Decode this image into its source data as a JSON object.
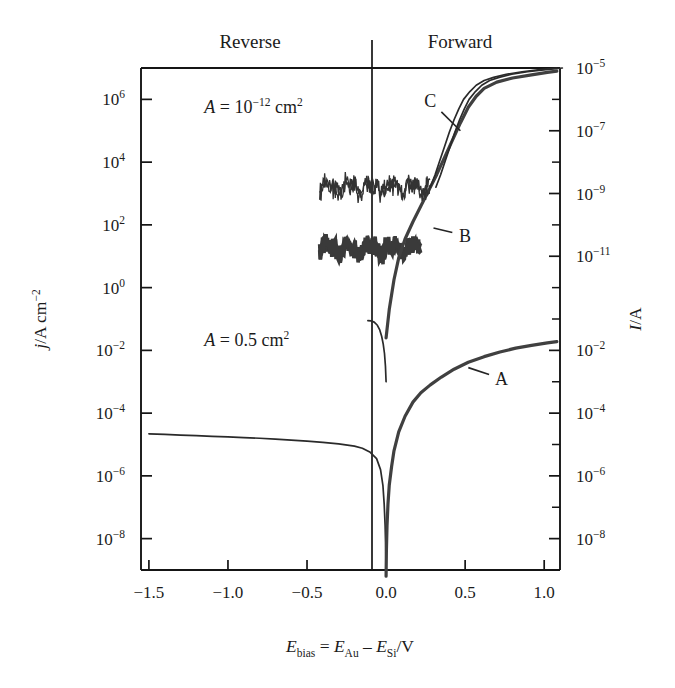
{
  "chart_data": {
    "type": "line",
    "title": "",
    "xlabel": "E_bias = E_Au − E_Si/V",
    "ylabel": "j/A cm^-2",
    "ylabel_right": "I/A",
    "xlim": [
      -1.55,
      1.1
    ],
    "x_ticks": [
      "-1.5",
      "-1.0",
      "-0.5",
      "0.0",
      "0.5",
      "1.0"
    ],
    "x_tick_values": [
      -1.5,
      -1.0,
      -0.5,
      0.0,
      0.5,
      1.0
    ],
    "y_left_ticks": [
      "10^6",
      "10^4",
      "10^2",
      "10^0",
      "10^-2",
      "10^-4",
      "10^-6",
      "10^-8"
    ],
    "y_left_exponents": [
      6,
      4,
      2,
      0,
      -2,
      -4,
      -6,
      -8
    ],
    "ylim_left": [
      -9,
      7
    ],
    "y_right_upper_ticks": [
      "10^-5",
      "10^-7",
      "10^-9",
      "10^-11"
    ],
    "y_right_upper_exponents": [
      -5,
      -7,
      -9,
      -11
    ],
    "y_right_lower_ticks": [
      "10^-2",
      "10^-4",
      "10^-6",
      "10^-8"
    ],
    "y_right_lower_exponents": [
      -2,
      -4,
      -6,
      -8
    ],
    "grid": false,
    "legend_position": "inline-annotations",
    "region_labels": [
      {
        "text": "Reverse",
        "x": -0.75
      },
      {
        "text": "Forward",
        "x": 0.42
      }
    ],
    "annotations": [
      {
        "label": "A = 10^-12 cm^2",
        "base": "A =",
        "mantissa": "10",
        "exponent": "-12",
        "unit": "cm",
        "unit_exponent": "2",
        "x": -1.15,
        "y_exp": 5.55
      },
      {
        "label": "A = 0.5 cm^2",
        "base": "A =",
        "mantissa": "0.5",
        "exponent": "",
        "unit": "cm",
        "unit_exponent": "2",
        "x": -1.15,
        "y_exp": -1.85
      }
    ],
    "series": [
      {
        "name": "A",
        "label": "A",
        "description": "Large-area (0.5 cm^2) Au/Si diode, j axis left, reverse plateau near 2e-5 A/cm^2",
        "label_x": 0.73,
        "label_y_exp": -3.1,
        "leader_from_x": 0.52,
        "leader_from_y_exp": -2.55,
        "points": [
          [
            -1.5,
            -4.66
          ],
          [
            -1.4,
            -4.68
          ],
          [
            -1.3,
            -4.7
          ],
          [
            -1.2,
            -4.72
          ],
          [
            -1.1,
            -4.74
          ],
          [
            -1.0,
            -4.76
          ],
          [
            -0.9,
            -4.78
          ],
          [
            -0.8,
            -4.8
          ],
          [
            -0.7,
            -4.83
          ],
          [
            -0.6,
            -4.86
          ],
          [
            -0.5,
            -4.89
          ],
          [
            -0.4,
            -4.93
          ],
          [
            -0.3,
            -4.98
          ],
          [
            -0.2,
            -5.05
          ],
          [
            -0.15,
            -5.12
          ],
          [
            -0.1,
            -5.25
          ],
          [
            -0.06,
            -5.45
          ],
          [
            -0.035,
            -5.8
          ],
          [
            -0.02,
            -6.3
          ],
          [
            -0.012,
            -6.9
          ],
          [
            -0.006,
            -7.6
          ],
          [
            -0.002,
            -8.4
          ],
          [
            0.0,
            -9.2
          ]
        ],
        "points_forward": [
          [
            0.0,
            -9.2
          ],
          [
            0.002,
            -8.4
          ],
          [
            0.006,
            -7.6
          ],
          [
            0.012,
            -6.9
          ],
          [
            0.02,
            -6.3
          ],
          [
            0.035,
            -5.7
          ],
          [
            0.05,
            -5.2
          ],
          [
            0.08,
            -4.6
          ],
          [
            0.12,
            -4.1
          ],
          [
            0.17,
            -3.65
          ],
          [
            0.22,
            -3.35
          ],
          [
            0.28,
            -3.1
          ],
          [
            0.35,
            -2.85
          ],
          [
            0.43,
            -2.6
          ],
          [
            0.52,
            -2.38
          ],
          [
            0.62,
            -2.2
          ],
          [
            0.72,
            -2.05
          ],
          [
            0.82,
            -1.93
          ],
          [
            0.92,
            -1.84
          ],
          [
            1.02,
            -1.76
          ],
          [
            1.08,
            -1.72
          ]
        ]
      },
      {
        "name": "B",
        "label": "B",
        "description": "Nanoscale junction, noisy floor near 10^-11 A, steep forward rise",
        "label_x": 0.5,
        "label_y_exp": 1.45,
        "leader_from_x": 0.3,
        "leader_from_y_exp": 1.9,
        "noise_range_x": [
          -0.42,
          0.22
        ],
        "noise_center_exp": 1.25,
        "noise_amplitude": 0.3,
        "points": [
          [
            0.0,
            -1.6
          ],
          [
            0.02,
            -0.7
          ],
          [
            0.05,
            0.25
          ],
          [
            0.08,
            0.95
          ],
          [
            0.12,
            1.55
          ],
          [
            0.17,
            2.1
          ],
          [
            0.22,
            2.6
          ],
          [
            0.27,
            3.1
          ],
          [
            0.32,
            3.6
          ],
          [
            0.37,
            4.15
          ],
          [
            0.42,
            4.7
          ],
          [
            0.47,
            5.25
          ],
          [
            0.52,
            5.75
          ],
          [
            0.57,
            6.1
          ],
          [
            0.62,
            6.35
          ],
          [
            0.7,
            6.55
          ],
          [
            0.8,
            6.68
          ],
          [
            0.92,
            6.78
          ],
          [
            1.02,
            6.86
          ],
          [
            1.08,
            6.9
          ]
        ]
      },
      {
        "name": "C",
        "label": "C",
        "description": "Nanoscale junction, noisy floor near 10^-9 A (j ~ 10^3), saturating forward branch",
        "label_x": 0.28,
        "label_y_exp": 5.75,
        "leader_from_x": 0.47,
        "leader_from_y_exp": 5.0,
        "noise_range_x": [
          -0.42,
          0.28
        ],
        "noise_center_exp": 3.2,
        "noise_amplitude": 0.33,
        "points": [
          [
            0.28,
            3.2
          ],
          [
            0.31,
            3.6
          ],
          [
            0.34,
            4.05
          ],
          [
            0.37,
            4.5
          ],
          [
            0.4,
            4.95
          ],
          [
            0.43,
            5.35
          ],
          [
            0.46,
            5.7
          ],
          [
            0.49,
            6.0
          ],
          [
            0.53,
            6.25
          ],
          [
            0.57,
            6.45
          ],
          [
            0.62,
            6.6
          ],
          [
            0.68,
            6.7
          ],
          [
            0.76,
            6.8
          ],
          [
            0.86,
            6.88
          ],
          [
            0.96,
            6.94
          ],
          [
            1.04,
            6.98
          ],
          [
            1.08,
            7.0
          ]
        ]
      },
      {
        "name": "B-reverse-hook",
        "label": "",
        "description": "Short reverse hook of nanoscale curve just left of 0 V",
        "points": [
          [
            -0.115,
            -1.05
          ],
          [
            -0.095,
            -1.06
          ],
          [
            -0.075,
            -1.1
          ],
          [
            -0.055,
            -1.2
          ],
          [
            -0.04,
            -1.35
          ],
          [
            -0.028,
            -1.55
          ],
          [
            -0.018,
            -1.8
          ],
          [
            -0.01,
            -2.1
          ],
          [
            -0.004,
            -2.5
          ],
          [
            0.0,
            -3.0
          ]
        ]
      }
    ]
  },
  "axes": {
    "left_title": {
      "symbol": "j",
      "slash_unit": "/A cm",
      "exponent": "-2"
    },
    "right_title": {
      "symbol": "I",
      "slash_unit": "/A"
    },
    "x_title": {
      "symbol": "E",
      "sub": "bias",
      "eq": " = ",
      "symbol2": "E",
      "sub2": "Au",
      "minus": " – ",
      "symbol3": "E",
      "sub3": "Si",
      "unit": "/V"
    }
  }
}
